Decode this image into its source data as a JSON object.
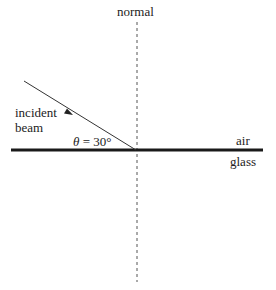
{
  "diagram": {
    "labels": {
      "normal": "normal",
      "incident_line1": "incident",
      "incident_line2": "beam",
      "theta_symbol": "θ",
      "theta_eq": " = 30°",
      "air": "air",
      "glass": "glass"
    },
    "angle_deg": 30,
    "colors": {
      "ink": "#222222",
      "interface": "#1a1a1a",
      "normal_line": "#555555",
      "beam": "#333333",
      "background": "#ffffff"
    }
  }
}
